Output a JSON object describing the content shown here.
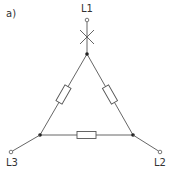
{
  "diagram": {
    "subfigure_label": "a)",
    "type": "delta (triangle) connection with three resistors",
    "terminals": [
      {
        "id": "L1",
        "label": "L1",
        "position": "top"
      },
      {
        "id": "L2",
        "label": "L2",
        "position": "bottom-right"
      },
      {
        "id": "L3",
        "label": "L3",
        "position": "bottom-left"
      }
    ],
    "components": [
      {
        "type": "resistor",
        "between": [
          "top-node",
          "left-node"
        ]
      },
      {
        "type": "resistor",
        "between": [
          "top-node",
          "right-node"
        ]
      },
      {
        "type": "resistor",
        "between": [
          "left-node",
          "right-node"
        ]
      }
    ],
    "annotations": [
      {
        "type": "cross-mark",
        "meaning": "broken/interrupted conductor",
        "on": "L1 line"
      }
    ],
    "colors": {
      "line": "#555555",
      "node": "#222222",
      "background": "#ffffff"
    }
  }
}
